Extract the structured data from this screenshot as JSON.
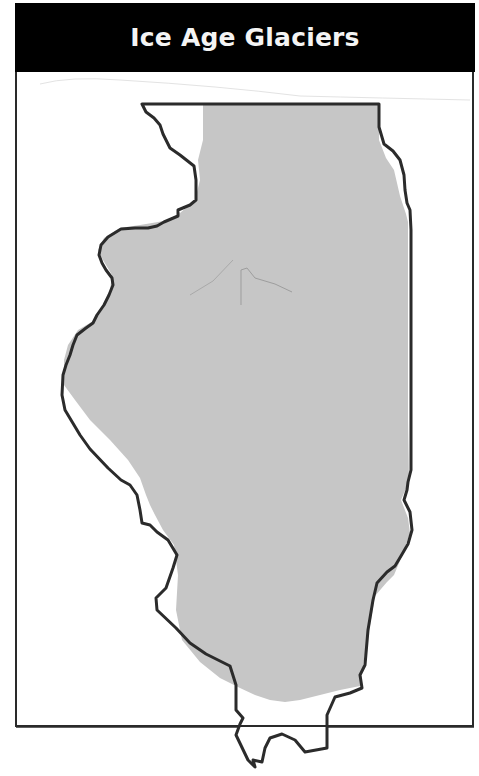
{
  "title": "Ice Age Glaciers",
  "map": {
    "region": "Illinois",
    "legend_meaning": "glaciated area shown in gray",
    "colors": {
      "glacier_fill": "#c6c6c6",
      "state_outline": "#2b2b2b",
      "title_bar": "#000000",
      "title_text": "#f4f4f4",
      "background": "#ffffff"
    }
  }
}
